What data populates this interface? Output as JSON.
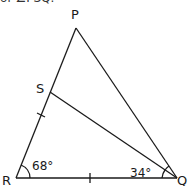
{
  "header": {
    "cut_off_text": "of ∠PSQ."
  },
  "diagram": {
    "type": "geometry-triangle",
    "points": {
      "P": {
        "label": "P",
        "x": 76,
        "y": 28
      },
      "R": {
        "label": "R",
        "x": 16,
        "y": 178
      },
      "Q": {
        "label": "Q",
        "x": 177,
        "y": 178
      },
      "S": {
        "label": "S",
        "x": 50,
        "y": 92
      }
    },
    "segments": [
      "PR",
      "PQ",
      "RQ",
      "SQ"
    ],
    "angles": {
      "R": {
        "label": "68°",
        "value": 68
      },
      "SQR": {
        "label": "34°",
        "value": 34
      }
    },
    "equal_marks": [
      "RS",
      "RQ"
    ],
    "stroke_color": "#1a1a1a"
  }
}
